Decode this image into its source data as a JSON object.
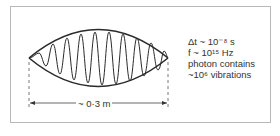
{
  "figure": {
    "annotations": {
      "delta_t": "Δt ~ 10⁻⁸ s",
      "frequency": "f ~ 10¹⁵ Hz",
      "line3": "photon contains",
      "line4": "~10⁶ vibrations"
    },
    "dimension_label": "~ 0·3 m",
    "colors": {
      "stroke": "#2a2a2a",
      "frame": "#b8b8b8",
      "text": "#333333"
    }
  }
}
